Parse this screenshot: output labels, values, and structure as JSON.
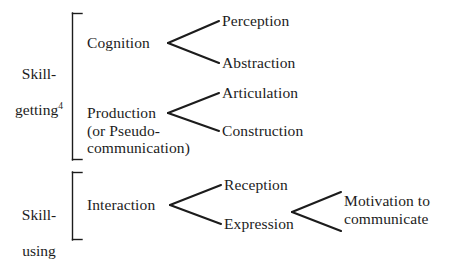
{
  "diagram": {
    "type": "tree",
    "background_color": "#ffffff",
    "ink_color": "#1c1c1c",
    "groups": [
      {
        "id": "skill-getting",
        "label_line1": "Skill-",
        "label_line2": "getting",
        "label_superscript": "4",
        "bracket": {
          "x": 72,
          "y_top": 13,
          "y_bottom": 160,
          "tick": 9
        }
      },
      {
        "id": "skill-using",
        "label_line1": "Skill-",
        "label_line2": "using",
        "label_superscript": "",
        "bracket": {
          "x": 72,
          "y_top": 172,
          "y_bottom": 240,
          "tick": 9
        }
      }
    ],
    "nodes": [
      {
        "id": "cognition",
        "label": "Cognition",
        "level": 1
      },
      {
        "id": "production",
        "label": "Production\n(or Pseudo-\ncommunication)",
        "level": 1
      },
      {
        "id": "interaction",
        "label": "Interaction",
        "level": 1
      },
      {
        "id": "perception",
        "label": "Perception",
        "level": 2
      },
      {
        "id": "abstraction",
        "label": "Abstraction",
        "level": 2
      },
      {
        "id": "articulation",
        "label": "Articulation",
        "level": 2
      },
      {
        "id": "construction",
        "label": "Construction",
        "level": 2
      },
      {
        "id": "reception",
        "label": "Reception",
        "level": 2
      },
      {
        "id": "expression",
        "label": "Expression",
        "level": 2
      },
      {
        "id": "motivation",
        "label": "Motivation to\ncommunicate",
        "level": 3
      }
    ],
    "edges": [
      {
        "from": "cognition",
        "to": "perception"
      },
      {
        "from": "cognition",
        "to": "abstraction"
      },
      {
        "from": "production",
        "to": "articulation"
      },
      {
        "from": "production",
        "to": "construction"
      },
      {
        "from": "interaction",
        "to": "reception"
      },
      {
        "from": "interaction",
        "to": "expression"
      },
      {
        "from": "expression",
        "to": "motivation"
      }
    ]
  }
}
